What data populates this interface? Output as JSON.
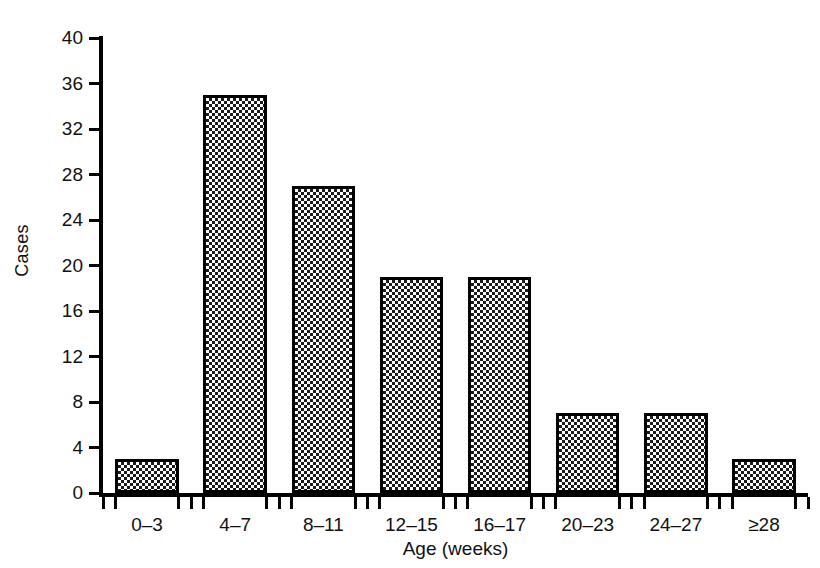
{
  "chart_data": {
    "type": "bar",
    "title": "",
    "xlabel": "Age (weeks)",
    "ylabel": "Cases",
    "categories": [
      "0–3",
      "4–7",
      "8–11",
      "12–15",
      "16–17",
      "20–23",
      "24–27",
      "≥28"
    ],
    "values": [
      3,
      35,
      27,
      19,
      19,
      7,
      7,
      3
    ],
    "ylim": [
      0,
      40
    ],
    "ytick_labels": [
      "0",
      "4",
      "8",
      "12",
      "16",
      "20",
      "24",
      "28",
      "32",
      "36",
      "40"
    ],
    "ytick_values": [
      0,
      4,
      8,
      12,
      16,
      20,
      24,
      28,
      32,
      36,
      40
    ],
    "grid": false,
    "legend": false,
    "bar_fill": "checkerboard-hatch",
    "bar_edge_color": "#000000",
    "background_color": "#ffffff",
    "text_color": "#111111"
  }
}
